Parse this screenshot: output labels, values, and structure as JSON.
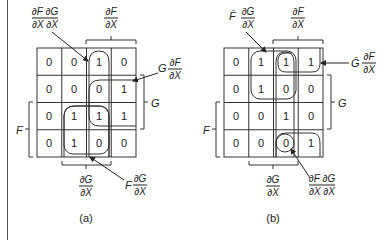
{
  "diagrams": [
    {
      "id": "a",
      "caption": "(a)",
      "grid": [
        [
          "0",
          "0",
          "1",
          "0"
        ],
        [
          "0",
          "0",
          "0",
          "1"
        ],
        [
          "0",
          "1",
          "1",
          "1"
        ],
        [
          "0",
          "1",
          "0",
          "0"
        ]
      ],
      "labels": {
        "top_left_num": "∂F ∂G",
        "top_left_den": "∂X ∂X",
        "top_mid_num": "∂F",
        "top_mid_den": "∂X",
        "right_top_prefix": "G",
        "right_top_num": "∂F",
        "right_top_den": "∂X",
        "right_side": "G",
        "left_side": "F",
        "bottom_num": "∂G",
        "bottom_den": "∂X",
        "bottom_right_prefix": "F",
        "bottom_right_num": "∂G",
        "bottom_right_den": "∂X"
      }
    },
    {
      "id": "b",
      "caption": "(b)",
      "grid": [
        [
          "0",
          "1",
          "1",
          "1"
        ],
        [
          "0",
          "1",
          "0",
          "0"
        ],
        [
          "0",
          "0",
          "1",
          "0"
        ],
        [
          "0",
          "0",
          "0",
          "1"
        ]
      ],
      "labels": {
        "top_left_prefix": "F̄",
        "top_left_num": "∂G",
        "top_left_den": "∂X",
        "top_mid_num": "∂F",
        "top_mid_den": "∂X",
        "right_top_prefix": "Ḡ",
        "right_top_num": "∂F",
        "right_top_den": "∂X",
        "right_side": "G",
        "left_side": "F",
        "bottom_num": "∂G",
        "bottom_den": "∂X",
        "bottom_right_num": "∂F ∂G",
        "bottom_right_den": "∂X ∂X"
      }
    }
  ]
}
